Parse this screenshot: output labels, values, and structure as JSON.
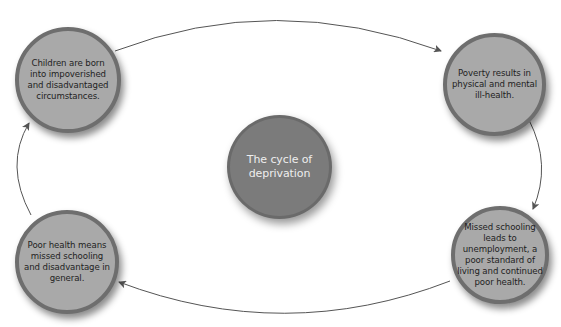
{
  "diagram": {
    "title": "The cycle of deprivation",
    "center": {
      "label": "The cycle of deprivation",
      "lines": [
        "The cycle of",
        "deprivation"
      ]
    },
    "nodes": [
      {
        "id": "children-born",
        "position": "top-left",
        "lines": [
          "Children are born",
          "into impoverished",
          "and disadvantaged",
          "circumstances."
        ]
      },
      {
        "id": "poverty-ill-health",
        "position": "top-right",
        "lines": [
          "Poverty results in",
          "physical and mental",
          "ill-health."
        ]
      },
      {
        "id": "missed-schooling-unemployment",
        "position": "bottom-right",
        "lines": [
          "Missed schooling",
          "leads to",
          "unemployment, a",
          "poor standard of",
          "living and continued",
          "poor health."
        ]
      },
      {
        "id": "poor-health-missed-schooling",
        "position": "bottom-left",
        "lines": [
          "Poor health means",
          "missed schooling",
          "and disadvantage in",
          "general."
        ]
      }
    ],
    "flow": [
      "children-born",
      "poverty-ill-health",
      "missed-schooling-unemployment",
      "poor-health-missed-schooling",
      "children-born"
    ],
    "colors": {
      "node_fill": "#a9a9a9",
      "node_border": "#6e6e6e",
      "center_fill": "#7b7b7b",
      "center_text": "#eeeeee",
      "arrow": "#555555",
      "text": "#1e1e1e"
    }
  }
}
